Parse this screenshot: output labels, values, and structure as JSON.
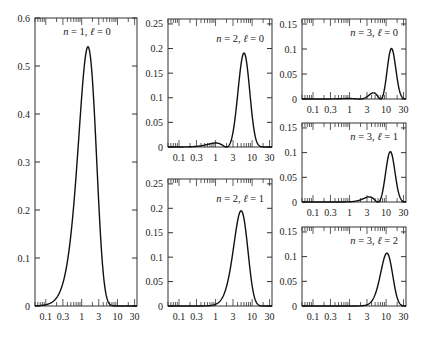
{
  "chart_data": [
    {
      "type": "line",
      "title": "n = 1, ℓ = 0",
      "label_n": "1",
      "label_l": "0",
      "xlabel": "",
      "ylabel": "",
      "xscale": "log",
      "xlim": [
        0.05,
        35
      ],
      "ylim": [
        0,
        0.6
      ],
      "yticks": [
        0,
        0.1,
        0.2,
        0.3,
        0.4,
        0.5,
        0.6
      ],
      "ytick_labels": [
        "0",
        "0.1",
        "0.2",
        "0.3",
        "0.4",
        "0.5",
        "0.6"
      ],
      "xticks": [
        0.1,
        0.3,
        1,
        3,
        10,
        30
      ],
      "xtick_labels": [
        "0.1",
        "0.3",
        "1",
        "3",
        "10",
        "30"
      ],
      "peaks": [
        {
          "x": 1.0,
          "y": 0.54
        }
      ],
      "frame": {
        "x": 35,
        "y": 18,
        "w": 102,
        "h": 288
      },
      "n": 1,
      "l": 0
    },
    {
      "type": "line",
      "title": "n = 2, ℓ = 0",
      "label_n": "2",
      "label_l": "0",
      "xscale": "log",
      "xlim": [
        0.05,
        35
      ],
      "ylim": [
        0,
        0.26
      ],
      "yticks": [
        0,
        0.05,
        0.1,
        0.15,
        0.2,
        0.25
      ],
      "ytick_labels": [
        "0",
        "0.05",
        "0.1",
        "0.15",
        "0.2",
        "0.25"
      ],
      "xticks": [
        0.1,
        0.3,
        1,
        3,
        10,
        30
      ],
      "xtick_labels": [
        "0.1",
        "0.3",
        "1",
        "3",
        "10",
        "30"
      ],
      "peaks": [
        {
          "x": 0.76,
          "y": 0.052
        },
        {
          "x": 5.2,
          "y": 0.191
        }
      ],
      "nodes": [
        2.0
      ],
      "frame": {
        "x": 168,
        "y": 19,
        "w": 104,
        "h": 128
      },
      "n": 2,
      "l": 0
    },
    {
      "type": "line",
      "title": "n = 2, ℓ = 1",
      "label_n": "2",
      "label_l": "1",
      "xscale": "log",
      "xlim": [
        0.05,
        35
      ],
      "ylim": [
        0,
        0.26
      ],
      "yticks": [
        0,
        0.05,
        0.1,
        0.15,
        0.2,
        0.25
      ],
      "ytick_labels": [
        "0",
        "0.05",
        "0.1",
        "0.15",
        "0.2",
        "0.25"
      ],
      "xticks": [
        0.1,
        0.3,
        1,
        3,
        10,
        30
      ],
      "xtick_labels": [
        "0.1",
        "0.3",
        "1",
        "3",
        "10",
        "30"
      ],
      "peaks": [
        {
          "x": 4.0,
          "y": 0.195
        }
      ],
      "frame": {
        "x": 168,
        "y": 179,
        "w": 104,
        "h": 127
      },
      "n": 2,
      "l": 1
    },
    {
      "type": "line",
      "title": "n = 3, ℓ = 0",
      "label_n": "3",
      "label_l": "0",
      "xscale": "log",
      "xlim": [
        0.05,
        35
      ],
      "ylim": [
        0,
        0.16
      ],
      "yticks": [
        0,
        0.05,
        0.1,
        0.15
      ],
      "ytick_labels": [
        "0",
        "0.05",
        "0.1",
        "0.15"
      ],
      "xticks": [
        0.1,
        0.3,
        1,
        3,
        10,
        30
      ],
      "xtick_labels": [
        "0.1",
        "0.3",
        "1",
        "3",
        "10",
        "30"
      ],
      "peaks": [
        {
          "x": 0.74,
          "y": 0.015
        },
        {
          "x": 4.2,
          "y": 0.039
        },
        {
          "x": 13.1,
          "y": 0.101
        }
      ],
      "nodes": [
        1.9,
        7.1
      ],
      "frame": {
        "x": 302,
        "y": 19,
        "w": 104,
        "h": 80
      },
      "n": 3,
      "l": 0
    },
    {
      "type": "line",
      "title": "n = 3, ℓ = 1",
      "label_n": "3",
      "label_l": "1",
      "xscale": "log",
      "xlim": [
        0.05,
        35
      ],
      "ylim": [
        0,
        0.16
      ],
      "yticks": [
        0,
        0.05,
        0.1,
        0.15
      ],
      "ytick_labels": [
        "0",
        "0.05",
        "0.1",
        "0.15"
      ],
      "xticks": [
        0.1,
        0.3,
        1,
        3,
        10,
        30
      ],
      "xtick_labels": [
        "0.1",
        "0.3",
        "1",
        "3",
        "10",
        "30"
      ],
      "peaks": [
        {
          "x": 3.0,
          "y": 0.04
        },
        {
          "x": 12.0,
          "y": 0.102
        }
      ],
      "nodes": [
        6.0
      ],
      "frame": {
        "x": 302,
        "y": 123,
        "w": 104,
        "h": 79
      },
      "n": 3,
      "l": 1
    },
    {
      "type": "line",
      "title": "n = 3, ℓ = 2",
      "label_n": "3",
      "label_l": "2",
      "xscale": "log",
      "xlim": [
        0.05,
        35
      ],
      "ylim": [
        0,
        0.16
      ],
      "yticks": [
        0,
        0.05,
        0.1,
        0.15
      ],
      "ytick_labels": [
        "0",
        "0.05",
        "0.1",
        "0.15"
      ],
      "xticks": [
        0.1,
        0.3,
        1,
        3,
        10,
        30
      ],
      "xtick_labels": [
        "0.1",
        "0.3",
        "1",
        "3",
        "10",
        "30"
      ],
      "peaks": [
        {
          "x": 9.0,
          "y": 0.107
        }
      ],
      "frame": {
        "x": 302,
        "y": 227,
        "w": 104,
        "h": 79
      },
      "n": 3,
      "l": 2
    }
  ],
  "style": {
    "line_color": "#111111",
    "axis_color": "#333333",
    "background": "#ffffff"
  }
}
